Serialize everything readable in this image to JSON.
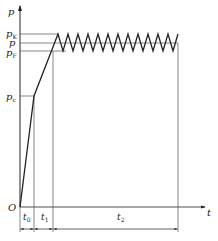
{
  "diagram": {
    "y_axis_label": "p",
    "x_axis_label": "t",
    "origin_label": "O",
    "levels": [
      {
        "id": "pK",
        "base": "p",
        "sub": "K"
      },
      {
        "id": "p",
        "base": "p",
        "sub": ""
      },
      {
        "id": "pF",
        "base": "p",
        "sub": "F"
      },
      {
        "id": "pc",
        "base": "p",
        "sub": "c"
      }
    ],
    "intervals": [
      {
        "id": "t0",
        "base": "t",
        "sub": "0"
      },
      {
        "id": "t1",
        "base": "t",
        "sub": "1"
      },
      {
        "id": "t2",
        "base": "t",
        "sub": "2"
      }
    ],
    "stroke_color": "#222222",
    "sawtooth_teeth": 12
  }
}
